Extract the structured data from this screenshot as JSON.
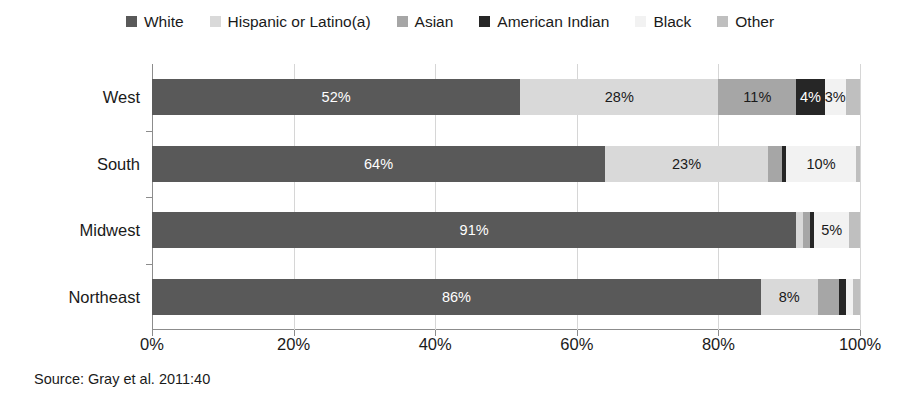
{
  "chart_data": {
    "type": "bar",
    "orientation": "horizontal",
    "stacked": true,
    "stack_mode": "percent",
    "title": "",
    "xlabel": "",
    "ylabel": "",
    "xlim": [
      0,
      100
    ],
    "xticks": [
      "0%",
      "20%",
      "40%",
      "60%",
      "80%",
      "100%"
    ],
    "xtick_values": [
      0,
      20,
      40,
      60,
      80,
      100
    ],
    "grid": "vertical",
    "legend_position": "top",
    "categories": [
      "West",
      "South",
      "Midwest",
      "Northeast"
    ],
    "series": [
      {
        "name": "White",
        "color": "#595959",
        "values": [
          52,
          64,
          91,
          86
        ],
        "labels": [
          "52%",
          "64%",
          "91%",
          "86%"
        ],
        "label_color": "#ffffff"
      },
      {
        "name": "Hispanic or Latino(a)",
        "color": "#d9d9d9",
        "values": [
          28,
          23,
          1,
          8
        ],
        "labels": [
          "28%",
          "23%",
          "",
          "8%"
        ],
        "label_color": "#1a1a1a"
      },
      {
        "name": "Asian",
        "color": "#a6a6a6",
        "values": [
          11,
          2,
          1,
          3
        ],
        "labels": [
          "11%",
          "",
          "",
          ""
        ],
        "label_color": "#1a1a1a"
      },
      {
        "name": "American Indian",
        "color": "#262626",
        "values": [
          4,
          0.5,
          0.5,
          1
        ],
        "labels": [
          "4%",
          "",
          "",
          ""
        ],
        "label_color": "#ffffff"
      },
      {
        "name": "Black",
        "color": "#f2f2f2",
        "values": [
          3,
          10,
          5,
          1
        ],
        "labels": [
          "3%",
          "10%",
          "5%",
          ""
        ],
        "label_color": "#1a1a1a"
      },
      {
        "name": "Other",
        "color": "#bfbfbf",
        "values": [
          2,
          0.5,
          1.5,
          1
        ],
        "labels": [
          "",
          "",
          "",
          ""
        ],
        "label_color": "#1a1a1a"
      }
    ]
  },
  "legend": {
    "items": [
      {
        "label": "White",
        "color": "#595959"
      },
      {
        "label": "Hispanic or Latino(a)",
        "color": "#d9d9d9"
      },
      {
        "label": "Asian",
        "color": "#a6a6a6"
      },
      {
        "label": "American Indian",
        "color": "#262626"
      },
      {
        "label": "Black",
        "color": "#f2f2f2"
      },
      {
        "label": "Other",
        "color": "#bfbfbf"
      }
    ]
  },
  "source_note": "Source: Gray et al. 2011:40"
}
